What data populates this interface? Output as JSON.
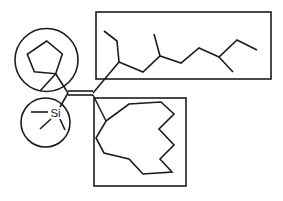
{
  "figure": {
    "kind": "chemical-structure-line-drawing",
    "canvas": {
      "width": 283,
      "height": 201,
      "background": "#ffffff"
    },
    "style": {
      "bond_color": "#1c1c1c",
      "bond_width": 1.6,
      "highlight_color": "#1c1c1c",
      "highlight_width": 1.6
    },
    "atom_labels": [
      {
        "name": "si-atom-label",
        "text": "Si",
        "x": 55.5,
        "y": 117,
        "font_size": 11.5
      }
    ],
    "shapes": [
      {
        "name": "highlight-box-alkyl-chain",
        "kind": "rect",
        "x": 96,
        "y": 12,
        "width": 175,
        "height": 67
      },
      {
        "name": "highlight-box-macrocycle",
        "kind": "rect",
        "x": 94,
        "y": 98,
        "width": 92,
        "height": 88
      },
      {
        "name": "highlight-circle-cyclopentyl",
        "kind": "circle",
        "cx": 46.5,
        "cy": 60,
        "r": 31.5
      },
      {
        "name": "highlight-circle-trimethylsilyl",
        "kind": "circle",
        "cx": 45.5,
        "cy": 122.5,
        "r": 24.5
      },
      {
        "name": "cyclopentane-ring",
        "kind": "polygon",
        "points": [
          [
            46.7,
            41
          ],
          [
            27.3,
            54.3
          ],
          [
            34.3,
            71.7
          ],
          [
            55.7,
            73.7
          ],
          [
            62.3,
            54
          ]
        ]
      },
      {
        "name": "bond-ring-to-c1",
        "kind": "polyline",
        "points": [
          [
            55.7,
            73.7
          ],
          [
            68,
            93
          ]
        ]
      },
      {
        "name": "bond-ring-methyl",
        "kind": "polyline",
        "points": [
          [
            55.7,
            73.7
          ],
          [
            40,
            91
          ]
        ]
      },
      {
        "name": "double-bond-line-upper",
        "kind": "polyline",
        "points": [
          [
            68,
            91
          ],
          [
            93,
            91
          ]
        ]
      },
      {
        "name": "double-bond-line-lower",
        "kind": "polyline",
        "points": [
          [
            68,
            95
          ],
          [
            93,
            95
          ]
        ]
      },
      {
        "name": "bond-c1-to-si",
        "kind": "polyline",
        "points": [
          [
            68,
            93
          ],
          [
            60,
            107
          ]
        ]
      },
      {
        "name": "si-methyl-left",
        "kind": "polyline",
        "points": [
          [
            48,
            112
          ],
          [
            31,
            112
          ]
        ]
      },
      {
        "name": "si-methyl-down-left",
        "kind": "polyline",
        "points": [
          [
            51,
            119
          ],
          [
            40,
            129
          ]
        ]
      },
      {
        "name": "si-methyl-down-right",
        "kind": "polyline",
        "points": [
          [
            60,
            119
          ],
          [
            65,
            130
          ]
        ]
      },
      {
        "name": "bond-c2-to-chain",
        "kind": "polyline",
        "points": [
          [
            93,
            93
          ],
          [
            119,
            62
          ]
        ]
      },
      {
        "name": "chain-ethyl-branch",
        "kind": "polyline",
        "points": [
          [
            119,
            62
          ],
          [
            117,
            41
          ],
          [
            104,
            31
          ]
        ]
      },
      {
        "name": "chain-main",
        "kind": "polyline",
        "points": [
          [
            119,
            62
          ],
          [
            143,
            72
          ],
          [
            160,
            56
          ],
          [
            181,
            63
          ],
          [
            199,
            48
          ],
          [
            219,
            57
          ],
          [
            237,
            40
          ],
          [
            257,
            50
          ]
        ]
      },
      {
        "name": "chain-methyl-branch-1",
        "kind": "polyline",
        "points": [
          [
            160,
            56
          ],
          [
            154,
            34
          ]
        ]
      },
      {
        "name": "chain-methyl-branch-2",
        "kind": "polyline",
        "points": [
          [
            219,
            57
          ],
          [
            233,
            72
          ]
        ]
      },
      {
        "name": "bond-c2-to-macrocycle",
        "kind": "polyline",
        "points": [
          [
            93,
            95
          ],
          [
            106,
            121
          ]
        ]
      },
      {
        "name": "macrocycle-ring",
        "kind": "polygon",
        "points": [
          [
            106,
            121
          ],
          [
            129,
            104
          ],
          [
            161,
            102
          ],
          [
            174,
            114
          ],
          [
            159,
            129
          ],
          [
            174,
            145
          ],
          [
            160,
            159
          ],
          [
            172,
            172
          ],
          [
            143,
            174
          ],
          [
            129,
            159
          ],
          [
            104,
            153
          ],
          [
            96,
            138
          ]
        ]
      }
    ]
  }
}
